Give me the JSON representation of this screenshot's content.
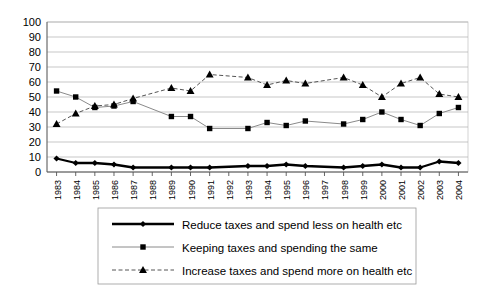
{
  "chart_data": {
    "type": "line",
    "title": "",
    "subtitle": "",
    "xlabel": "",
    "ylabel": "",
    "ylim": [
      0,
      100
    ],
    "ytick_step": 10,
    "yticks": [
      0,
      10,
      20,
      30,
      40,
      50,
      60,
      70,
      80,
      90,
      100
    ],
    "grid": true,
    "grid_axis": "y",
    "legend_position": "bottom",
    "categories": [
      "1983",
      "1984",
      "1985",
      "1986",
      "1987",
      "1988",
      "1989",
      "1990",
      "1991",
      "1992",
      "1993",
      "1994",
      "1995",
      "1996",
      "1997",
      "1998",
      "1999",
      "2000",
      "2001",
      "2002",
      "2003",
      "2004"
    ],
    "series": [
      {
        "name": "Reduce taxes and spend less on health etc",
        "marker": "diamond",
        "line_style": "solid",
        "line_width": "thick",
        "color": "#000000",
        "values": [
          9,
          6,
          6,
          5,
          3,
          null,
          3,
          3,
          3,
          null,
          4,
          4,
          5,
          4,
          null,
          3,
          4,
          5,
          3,
          3,
          7,
          6
        ]
      },
      {
        "name": "Keeping taxes and spending the same",
        "marker": "square",
        "line_style": "solid",
        "line_width": "thin",
        "color": "#8a8a8a",
        "values": [
          54,
          50,
          43,
          44,
          47,
          null,
          37,
          37,
          29,
          null,
          29,
          33,
          31,
          34,
          null,
          32,
          35,
          40,
          35,
          31,
          39,
          43
        ]
      },
      {
        "name": "Increase taxes and spend more on health etc",
        "marker": "triangle",
        "line_style": "dashed",
        "line_width": "thin",
        "color": "#555555",
        "values": [
          32,
          39,
          44,
          45,
          49,
          null,
          56,
          54,
          65,
          null,
          63,
          58,
          61,
          59,
          null,
          63,
          58,
          50,
          59,
          63,
          52,
          50
        ]
      }
    ]
  },
  "legend": {
    "entries": [
      {
        "label": "Reduce taxes and spend less on health etc",
        "marker": "diamond-marker"
      },
      {
        "label": "Keeping taxes and spending the same",
        "marker": "square-marker"
      },
      {
        "label": "Increase taxes and spend more on health etc",
        "marker": "triangle-marker"
      }
    ]
  },
  "axes": {
    "y_labels": [
      "100",
      "90",
      "80",
      "70",
      "60",
      "50",
      "40",
      "30",
      "20",
      "10",
      "0"
    ],
    "x_labels": [
      "1983",
      "1984",
      "1985",
      "1986",
      "1987",
      "1988",
      "1989",
      "1990",
      "1991",
      "1992",
      "1993",
      "1994",
      "1995",
      "1996",
      "1997",
      "1998",
      "1999",
      "2000",
      "2001",
      "2002",
      "2003",
      "2004"
    ]
  },
  "colors": {
    "background": "#ffffff",
    "gridline": "#b0b0b0",
    "axis": "#555555",
    "series_reduce": "#000000",
    "series_keeping": "#8a8a8a",
    "series_increase": "#555555",
    "legend_border": "#9a9a9a"
  }
}
